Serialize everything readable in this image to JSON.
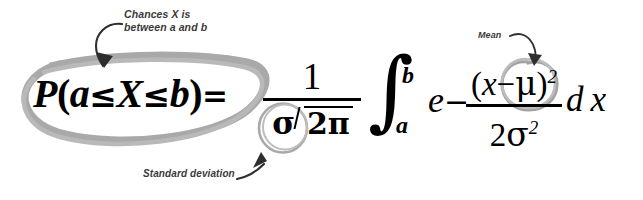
{
  "image": {
    "kind": "annotated-math-formula",
    "background_color": "#ffffff",
    "ink_color": "#000000",
    "highlight_color": "#a6a6a6",
    "annotation_color": "#3a3a3a",
    "width": 643,
    "height": 200
  },
  "annotations": {
    "chances": {
      "line1": "Chances X is",
      "line2": "between a and b",
      "points_to": "probability-expression"
    },
    "mean": {
      "label": "Mean",
      "points_to": "mu-symbol"
    },
    "stddev": {
      "label": "Standard deviation",
      "points_to": "sigma-symbol"
    }
  },
  "formula": {
    "full_latex": "P(a \\le X \\le b) = \\frac{1}{\\sigma\\sqrt{2\\pi}} \\int_a^b e^{-\\frac{(x-\\mu)^2}{2\\sigma^2}} dx",
    "lhs": {
      "probability": "P",
      "open_paren": "(",
      "lower_bound": "a",
      "le1": "≤",
      "variable": "X",
      "le2": "≤",
      "upper_bound": "b",
      "close_paren": ")",
      "equals": "=",
      "text": "P(a≤X≤b)="
    },
    "coefficient_fraction": {
      "numerator": "1",
      "denominator_sigma": "σ",
      "denominator_radicand": "2π",
      "denominator_text": "σ√(2π)"
    },
    "integral": {
      "symbol": "∫",
      "lower_limit": "a",
      "upper_limit": "b"
    },
    "exponential": {
      "base": "e",
      "sign": "−"
    },
    "exponent_fraction": {
      "numerator_open": "(",
      "numerator_x": "x",
      "numerator_minus": "−",
      "numerator_mu": "μ",
      "numerator_close": ")",
      "numerator_power": "2",
      "numerator_text": "(x−μ)",
      "denominator_two": "2",
      "denominator_sigma": "σ",
      "denominator_power": "2",
      "denominator_text": "2σ"
    },
    "differential": "d x"
  },
  "highlights": {
    "probability_ellipse": "hand-drawn ellipse around P(a≤X≤b)",
    "sigma_circle": "hand-drawn circle around σ in denominator",
    "mu_circle": "hand-drawn circle around μ in numerator"
  }
}
